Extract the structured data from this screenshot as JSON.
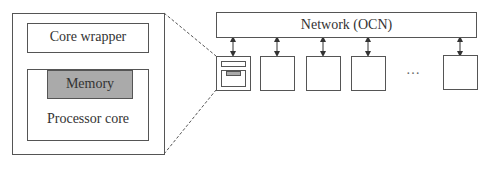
{
  "detail": {
    "core_wrapper_label": "Core wrapper",
    "memory_label": "Memory",
    "processor_core_label": "Processor core"
  },
  "network": {
    "label": "Network (OCN)"
  },
  "tiles": {
    "ellipsis": "…",
    "count_visible": 5
  },
  "colors": {
    "memory_fill": "#aaaaaa",
    "stroke": "#555555"
  }
}
